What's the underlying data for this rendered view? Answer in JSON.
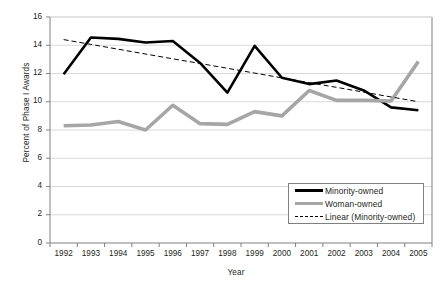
{
  "chart_data": {
    "type": "line",
    "title": "",
    "xlabel": "Year",
    "ylabel": "Percent of Phase I Awards",
    "categories": [
      1992,
      1993,
      1994,
      1995,
      1996,
      1997,
      1998,
      1999,
      2000,
      2001,
      2002,
      2003,
      2004,
      2005
    ],
    "xtick_labels": [
      "1992",
      "1993",
      "1994",
      "1995",
      "1996",
      "1997",
      "1998",
      "1999",
      "2000",
      "2001",
      "2002",
      "2003",
      "2004",
      "2005"
    ],
    "ytick_labels": [
      "0",
      "2",
      "4",
      "6",
      "8",
      "10",
      "12",
      "14",
      "16"
    ],
    "ytick_values": [
      0,
      2,
      4,
      6,
      8,
      10,
      12,
      14,
      16
    ],
    "ylim": [
      0,
      16
    ],
    "grid": "horizontal",
    "legend_position": "inside-lower-right",
    "series": [
      {
        "name": "Minority-owned",
        "style": "solid",
        "color": "#000000",
        "width": 2.6,
        "values": [
          11.95,
          14.55,
          14.45,
          14.2,
          14.3,
          12.75,
          10.65,
          13.95,
          11.7,
          11.25,
          11.5,
          10.8,
          9.6,
          9.4
        ]
      },
      {
        "name": "Woman-owned",
        "style": "solid",
        "color": "#a6a6a6",
        "width": 3.6,
        "values": [
          8.3,
          8.35,
          8.6,
          8.0,
          9.75,
          8.45,
          8.4,
          9.3,
          9.0,
          10.8,
          10.1,
          10.1,
          10.05,
          12.85
        ]
      },
      {
        "name": "Linear (Minority-owned)",
        "style": "dashed",
        "color": "#000000",
        "width": 1,
        "values": [
          14.4,
          14.06,
          13.72,
          13.38,
          13.04,
          12.71,
          12.37,
          12.03,
          11.69,
          11.35,
          11.02,
          10.68,
          10.34,
          10.0
        ]
      }
    ],
    "legend": [
      "Minority-owned",
      "Woman-owned",
      "Linear (Minority-owned)"
    ]
  },
  "legend_items": [
    {
      "label": "Minority-owned"
    },
    {
      "label": "Woman-owned"
    },
    {
      "label": "Linear (Minority-owned)"
    }
  ]
}
